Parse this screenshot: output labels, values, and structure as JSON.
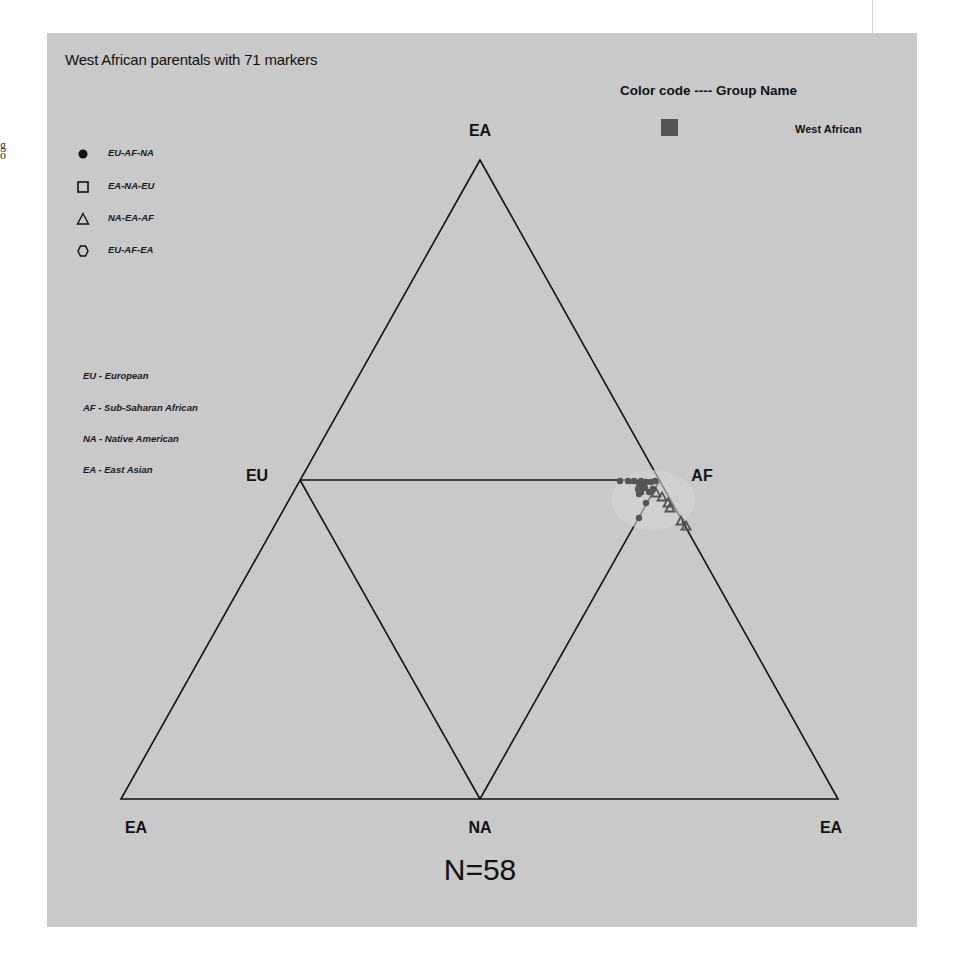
{
  "page": {
    "stray_margin_text": "g\no"
  },
  "chart": {
    "title": "West African parentals with 71 markers",
    "group_legend": {
      "header": "Color code ---- Group Name",
      "groups": [
        {
          "name": "West African",
          "color": "#555555"
        }
      ]
    },
    "shape_legend": [
      {
        "shape": "filled-circle",
        "label": "EU-AF-NA"
      },
      {
        "shape": "open-square",
        "label": "EA-NA-EU"
      },
      {
        "shape": "open-triangle",
        "label": "NA-EA-AF"
      },
      {
        "shape": "open-hexagon",
        "label": "EU-AF-EA"
      }
    ],
    "abbreviations": [
      {
        "label": "EU - European"
      },
      {
        "label": "AF - Sub-Saharan African"
      },
      {
        "label": "NA - Native American"
      },
      {
        "label": "EA - East Asian"
      }
    ],
    "vertex_labels": {
      "top": "EA",
      "left_mid": "EU",
      "right_mid": "AF",
      "bottom_left": "EA",
      "bottom_mid": "NA",
      "bottom_right": "EA"
    },
    "sample_size": "N=58"
  },
  "chart_data": {
    "type": "scatter",
    "subtype": "unfolded-tetrahedron ternary plot",
    "title": "West African parentals with 71 markers",
    "annotation": "N=58",
    "vertices": [
      "EA",
      "EU",
      "AF",
      "NA",
      "EA",
      "EA"
    ],
    "legend_position": "top-left (shapes), top-right (groups)",
    "series": [
      {
        "name": "West African",
        "color": "#555555",
        "n": 58,
        "description": "Points cluster tightly at the AF vertex, spreading slightly along the EU-AF edge, AF-NA edge, and AF-EA edge",
        "points_px": [
          {
            "shape": "filled-circle",
            "x": 620,
            "y": 481
          },
          {
            "shape": "filled-circle",
            "x": 628,
            "y": 481
          },
          {
            "shape": "filled-circle",
            "x": 634,
            "y": 481
          },
          {
            "shape": "filled-circle",
            "x": 641,
            "y": 481
          },
          {
            "shape": "filled-circle",
            "x": 646,
            "y": 482
          },
          {
            "shape": "filled-circle",
            "x": 651,
            "y": 482
          },
          {
            "shape": "filled-circle",
            "x": 655,
            "y": 481
          },
          {
            "shape": "filled-circle",
            "x": 638,
            "y": 489
          },
          {
            "shape": "filled-circle",
            "x": 639,
            "y": 494
          },
          {
            "shape": "filled-circle",
            "x": 645,
            "y": 488
          },
          {
            "shape": "filled-circle",
            "x": 649,
            "y": 492
          },
          {
            "shape": "filled-circle",
            "x": 653,
            "y": 489
          },
          {
            "shape": "filled-circle",
            "x": 646,
            "y": 503
          },
          {
            "shape": "filled-circle",
            "x": 639,
            "y": 518
          },
          {
            "shape": "open-triangle",
            "x": 656,
            "y": 493
          },
          {
            "shape": "open-triangle",
            "x": 662,
            "y": 497
          },
          {
            "shape": "open-triangle",
            "x": 668,
            "y": 503
          },
          {
            "shape": "open-triangle",
            "x": 670,
            "y": 508
          },
          {
            "shape": "open-triangle",
            "x": 681,
            "y": 521
          },
          {
            "shape": "open-triangle",
            "x": 686,
            "y": 526
          }
        ]
      }
    ],
    "grid": false
  }
}
